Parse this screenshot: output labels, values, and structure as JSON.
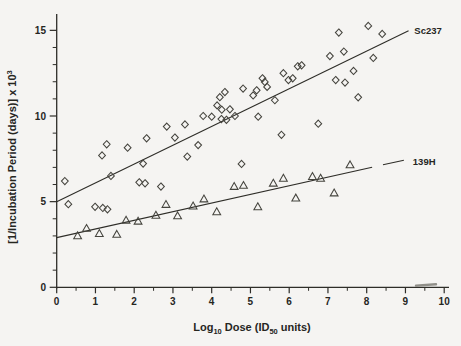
{
  "figure": {
    "background": "#f5f4f2",
    "ink": "#2e2d28",
    "marker_ink": "#45443e"
  },
  "chart_data": {
    "type": "scatter",
    "title": "",
    "xlabel": "Log10 Dose (ID50 units)",
    "xlabel_parts": {
      "prefix": "Log",
      "sub1": "10",
      "mid": " Dose  (ID",
      "sub2": "50",
      "suffix": " units)"
    },
    "ylabel": "[1/Incubation Period (days)] x 10^3",
    "ylabel_parts": {
      "main": "[1/Incubation  Period  (days)]  x  10",
      "sup": "3"
    },
    "xlim": [
      0,
      10.1
    ],
    "ylim": [
      0,
      15.9
    ],
    "grid": false,
    "legend_position": "line-end-labels",
    "x_major_ticks": [
      0,
      1,
      2,
      3,
      4,
      5,
      6,
      7,
      8,
      9,
      10
    ],
    "x_minor_step": 0.5,
    "y_major_ticks": [
      0,
      5,
      10,
      15
    ],
    "y_minor_step": 1,
    "series": [
      {
        "name": "Sc237",
        "marker": "diamond",
        "points": [
          [
            0.21,
            6.2
          ],
          [
            0.3,
            4.85
          ],
          [
            0.99,
            4.7
          ],
          [
            1.17,
            7.7
          ],
          [
            1.19,
            4.63
          ],
          [
            1.29,
            8.35
          ],
          [
            1.31,
            4.55
          ],
          [
            1.4,
            6.5
          ],
          [
            1.83,
            8.15
          ],
          [
            2.13,
            6.13
          ],
          [
            2.23,
            7.22
          ],
          [
            2.28,
            6.07
          ],
          [
            2.32,
            8.7
          ],
          [
            2.69,
            5.88
          ],
          [
            2.84,
            9.38
          ],
          [
            3.05,
            8.74
          ],
          [
            3.31,
            9.51
          ],
          [
            3.37,
            7.63
          ],
          [
            3.65,
            8.3
          ],
          [
            3.78,
            10.0
          ],
          [
            4.0,
            9.96
          ],
          [
            4.14,
            10.62
          ],
          [
            4.21,
            11.1
          ],
          [
            4.25,
            9.82
          ],
          [
            4.26,
            10.37
          ],
          [
            4.34,
            11.4
          ],
          [
            4.38,
            9.78
          ],
          [
            4.47,
            10.39
          ],
          [
            4.6,
            10.0
          ],
          [
            4.77,
            7.2
          ],
          [
            4.81,
            11.6
          ],
          [
            5.07,
            11.2
          ],
          [
            5.16,
            11.5
          ],
          [
            5.2,
            9.96
          ],
          [
            5.31,
            12.2
          ],
          [
            5.37,
            11.99
          ],
          [
            5.43,
            11.7
          ],
          [
            5.63,
            10.92
          ],
          [
            5.8,
            8.9
          ],
          [
            5.85,
            12.5
          ],
          [
            5.98,
            12.1
          ],
          [
            6.09,
            12.2
          ],
          [
            6.22,
            12.9
          ],
          [
            6.32,
            12.96
          ],
          [
            6.75,
            9.55
          ],
          [
            7.05,
            13.5
          ],
          [
            7.2,
            12.1
          ],
          [
            7.28,
            14.87
          ],
          [
            7.41,
            13.76
          ],
          [
            7.44,
            11.95
          ],
          [
            7.66,
            12.63
          ],
          [
            7.78,
            11.09
          ],
          [
            8.04,
            15.26
          ],
          [
            8.17,
            13.39
          ],
          [
            8.4,
            14.79
          ]
        ]
      },
      {
        "name": "139H",
        "marker": "triangle",
        "points": [
          [
            0.54,
            3.0
          ],
          [
            0.77,
            3.43
          ],
          [
            1.1,
            3.13
          ],
          [
            1.55,
            3.08
          ],
          [
            1.79,
            3.91
          ],
          [
            2.1,
            3.85
          ],
          [
            2.56,
            4.2
          ],
          [
            2.82,
            4.83
          ],
          [
            3.12,
            4.16
          ],
          [
            3.52,
            4.74
          ],
          [
            3.8,
            5.15
          ],
          [
            4.13,
            4.4
          ],
          [
            4.58,
            5.88
          ],
          [
            4.82,
            5.94
          ],
          [
            5.19,
            4.69
          ],
          [
            5.59,
            6.07
          ],
          [
            5.85,
            6.36
          ],
          [
            6.17,
            5.2
          ],
          [
            6.6,
            6.46
          ],
          [
            6.81,
            6.36
          ],
          [
            7.16,
            5.5
          ],
          [
            7.57,
            7.14
          ]
        ]
      }
    ],
    "fit_lines": [
      {
        "label": "Sc237",
        "segments": [
          [
            0,
            5.0,
            9.08,
            14.97
          ]
        ],
        "label_x": 9.23,
        "label_y": 14.95
      },
      {
        "label": "139H",
        "segments": [
          [
            0,
            2.9,
            8.14,
            7.01
          ],
          [
            8.42,
            7.15,
            8.96,
            7.42
          ]
        ],
        "label_x": 9.19,
        "label_y": 7.33
      }
    ]
  }
}
